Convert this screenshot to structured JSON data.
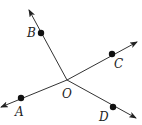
{
  "diagram": {
    "origin": {
      "label": "O",
      "x": 67,
      "y": 80,
      "label_x": 62,
      "label_y": 98
    },
    "rays": [
      {
        "name": "B",
        "label": "B",
        "tip": [
          29,
          10
        ],
        "point": [
          41,
          33
        ],
        "label_pos": [
          27,
          37
        ]
      },
      {
        "name": "C",
        "label": "C",
        "tip": [
          137,
          42
        ],
        "point": [
          112,
          54
        ],
        "label_pos": [
          114,
          68
        ]
      },
      {
        "name": "A",
        "label": "A",
        "tip": [
          1,
          107
        ],
        "point": [
          21,
          98
        ],
        "label_pos": [
          15,
          116
        ]
      },
      {
        "name": "D",
        "label": "D",
        "tip": [
          136,
          118
        ],
        "point": [
          113,
          107
        ],
        "label_pos": [
          99,
          121
        ]
      }
    ],
    "colors": {
      "line": "#333333",
      "point": "#111111",
      "text": "#222222"
    }
  }
}
